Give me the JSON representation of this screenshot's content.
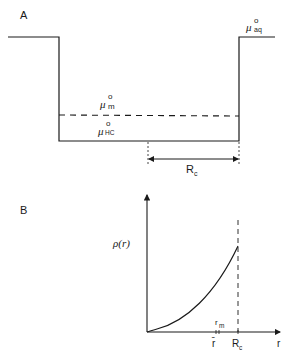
{
  "figure": {
    "panel_a": {
      "label": "A",
      "levels": {
        "aq": {
          "symbol": "μ",
          "sup": "o",
          "sub": "aq"
        },
        "m": {
          "symbol": "μ",
          "sup": "o",
          "sub": "m"
        },
        "hc": {
          "symbol": "μ",
          "sup": "o",
          "sub": "HC"
        }
      },
      "dimension": {
        "symbol": "R",
        "sub": "c"
      }
    },
    "panel_b": {
      "label": "B",
      "y_axis_label": "ρ(r)",
      "x_axis_label": "r",
      "x_ticks": [
        {
          "label": "r̄",
          "position": "below"
        },
        {
          "symbol": "r",
          "sub": "m",
          "position": "above"
        },
        {
          "symbol": "R",
          "sub": "c",
          "position": "below"
        }
      ]
    }
  },
  "colors": {
    "ink": "#1a1a1a",
    "background": "#ffffff"
  }
}
